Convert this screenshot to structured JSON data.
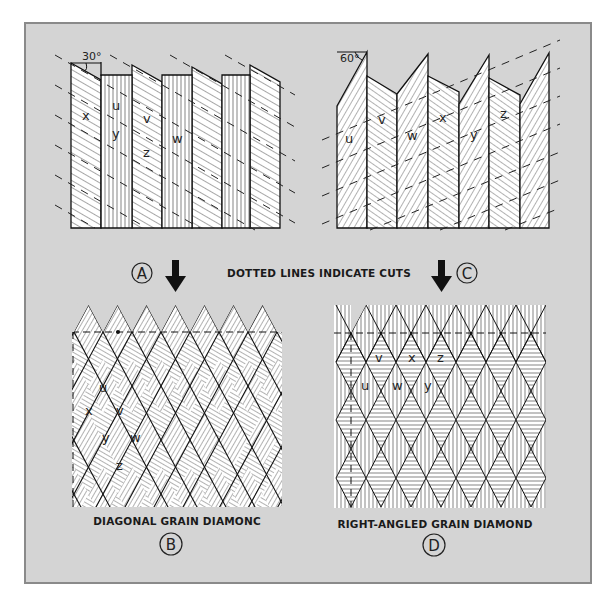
{
  "figure": {
    "caption_center": "DOTTED LINES INDICATE CUTS",
    "panels": {
      "A": {
        "label": "A",
        "angle_label": "30°",
        "strip_letters": [
          "x",
          "u",
          "y",
          "v",
          "z",
          "w"
        ]
      },
      "B": {
        "label": "B",
        "title": "DIAGONAL GRAIN DIAMONC",
        "diamond_letters": [
          "u",
          "x",
          "v",
          "y",
          "w",
          "z"
        ]
      },
      "C": {
        "label": "C",
        "angle_label": "60°",
        "strip_letters": [
          "u",
          "v",
          "w",
          "x",
          "y",
          "z"
        ]
      },
      "D": {
        "label": "D",
        "title": "RIGHT-ANGLED GRAIN DIAMOND",
        "diamond_letters": [
          "v",
          "x",
          "z",
          "u",
          "w",
          "y"
        ]
      }
    },
    "colors": {
      "background": "#d4d4d4",
      "frame_border": "#8a8a8a",
      "ink": "#1a1a1a",
      "paper": "#ffffff"
    }
  }
}
